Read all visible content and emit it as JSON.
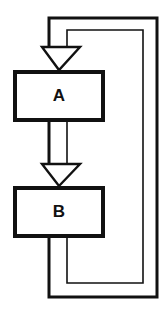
{
  "diagram": {
    "background_color": "#ffffff",
    "line_color": "#111111",
    "fill_color": "#ffffff",
    "nodes": [
      {
        "id": "a",
        "label": "A",
        "shape": "rectangle",
        "x": 13,
        "y": 70,
        "width": 92,
        "height": 52
      },
      {
        "id": "b",
        "label": "B",
        "shape": "rectangle",
        "x": 13,
        "y": 186,
        "width": 92,
        "height": 52
      }
    ],
    "connectors": [
      {
        "id": "entry-to-a",
        "from": "feedback-loops",
        "to": "a",
        "arrowhead": "hollow-triangle",
        "direction": "down"
      },
      {
        "id": "a-to-b",
        "from": "a",
        "to": "b",
        "arrowhead": "hollow-triangle",
        "direction": "down"
      }
    ],
    "feedback_loops": [
      {
        "id": "outer-loop",
        "from": "b",
        "to": "entry-to-a",
        "route": "bottom-right-top",
        "stroke_width": 3
      },
      {
        "id": "inner-loop",
        "from": "b",
        "to": "entry-to-a",
        "route": "bottom-right-top",
        "stroke_width": 1.6
      }
    ]
  }
}
